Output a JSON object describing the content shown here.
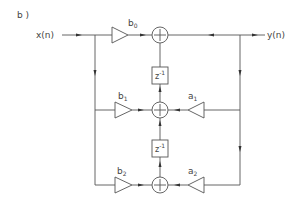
{
  "figure_label": "b )",
  "input_label": "x(n)",
  "output_label": "y(n)",
  "delay_label": "z",
  "delay_exp": "-1",
  "feedforward": [
    {
      "base": "b",
      "sub": "0"
    },
    {
      "base": "b",
      "sub": "1"
    },
    {
      "base": "b",
      "sub": "2"
    }
  ],
  "feedback": [
    {
      "base": "a",
      "sub": "1"
    },
    {
      "base": "a",
      "sub": "2"
    }
  ]
}
